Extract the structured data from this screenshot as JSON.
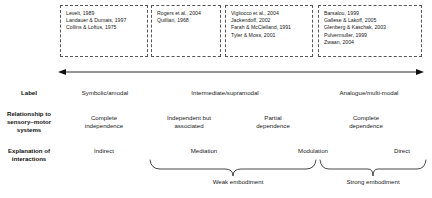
{
  "figure": {
    "citation_boxes": [
      {
        "name": "symbolic-amodal-citations",
        "citations": [
          "Levelt, 1989",
          "Landauer & Dumais, 1997",
          "Collins & Loftus, 1975"
        ]
      },
      {
        "name": "rogers-quillian-citations",
        "citations": [
          "Rogers et al., 2004",
          "Quillian, 1968"
        ]
      },
      {
        "name": "intermediate-supramodal-citations",
        "citations": [
          "Vigliocco et al., 2004",
          "Jackendoff, 2002",
          "Farah & McClelland, 1991",
          "Tyler & Moss, 2001"
        ]
      },
      {
        "name": "analogue-multimodal-citations",
        "citations": [
          "Barsalou, 1999",
          "Gallese & Lakoff, 2005",
          "Glenberg & Kaschak, 2003",
          "Pulvermuller, 1999",
          "Zwaan, 2004"
        ]
      }
    ],
    "rows": [
      {
        "label": "Label",
        "values": [
          "Symbolic/amodal",
          "Intermediate/supramodal",
          "Analogue/multi-modal"
        ]
      },
      {
        "label": "Relationship to sensory–motor systems",
        "label_lines": [
          "Relationship to",
          "sensory–motor",
          "systems"
        ],
        "values": [
          "Complete independence",
          "Independent but associated",
          "Partial dependence",
          "Complete dependence"
        ],
        "value_lines": [
          [
            "Complete",
            "independence"
          ],
          [
            "Independent but",
            "associated"
          ],
          [
            "Partial",
            "dependence"
          ],
          [
            "Complete",
            "dependence"
          ]
        ]
      },
      {
        "label": "Explanation of interactions",
        "label_lines": [
          "Explanation of",
          "interactions"
        ],
        "values": [
          "Indirect",
          "Mediation",
          "Modulation",
          "Direct"
        ]
      }
    ],
    "braces": [
      {
        "label": "Weak embodiment"
      },
      {
        "label": "Strong embodiment"
      }
    ],
    "arrow": {
      "name": "continuum-arrow",
      "direction": "double-headed"
    },
    "colors": {
      "text": "#1a1a1a",
      "box_border": "#555555",
      "arrow": "#111111",
      "brace": "#333333",
      "background": "#ffffff"
    }
  }
}
